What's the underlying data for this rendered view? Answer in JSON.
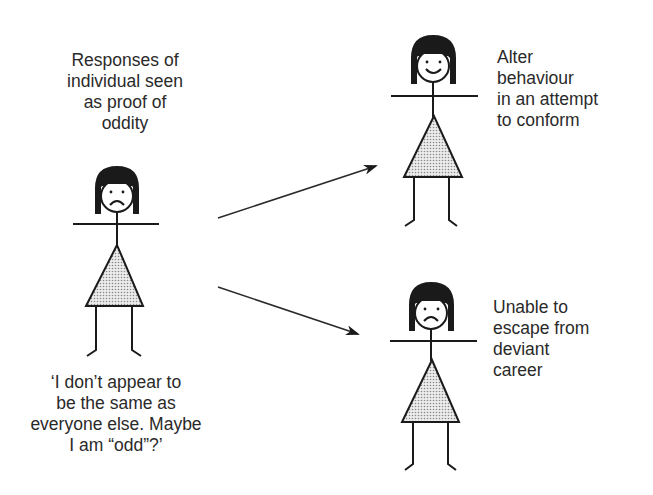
{
  "diagram": {
    "top_caption": "Responses of\nindividual seen\nas proof of\noddity",
    "bottom_quote": "‘I don’t appear to\nbe the same as\neveryone else. Maybe\nI am “odd”?’",
    "outcomes": [
      {
        "label": "Alter\nbehaviour\nin an attempt\nto conform",
        "expression": "smiling"
      },
      {
        "label": "Unable to\nescape from\ndeviant\ncareer",
        "expression": "sad"
      }
    ],
    "central_figure": {
      "expression": "sad"
    },
    "colors": {
      "ink": "#1a1a1a",
      "skirt_fill": "#d8d8d8",
      "text": "#2a2a2a"
    }
  }
}
